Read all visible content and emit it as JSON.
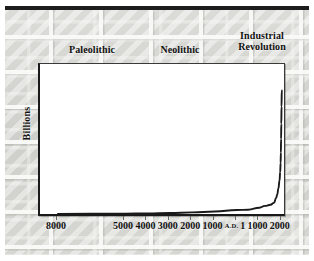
{
  "figure": {
    "title_eras": [
      {
        "label": "Paleolithic",
        "name": "era-label-paleolithic"
      },
      {
        "label": "Neolithic",
        "name": "era-label-neolithic"
      },
      {
        "label": "Industrial\nRevolution",
        "name": "era-label-industrial-revolution"
      }
    ],
    "background": "stone-wall-texture",
    "colors": {
      "wall": "#d6d6d2",
      "plot_background": "#ffffff",
      "axis": "#1a1a1a",
      "curve": "#1a1a1a",
      "text": "#111111"
    }
  },
  "eras": {
    "paleolithic": "Paleolithic",
    "neolithic": "Neolithic",
    "industrial_line1": "Industrial",
    "industrial_line2": "Revolution"
  },
  "axis": {
    "y_title": "Billions",
    "y_ticks": [
      "7",
      "6",
      "5",
      "4",
      "3",
      "2",
      "1"
    ],
    "x_ticks": [
      "8000",
      "5000",
      "4000",
      "3000",
      "2000",
      "1000",
      "1",
      "1000",
      "2000"
    ],
    "x_ad_prefix": "A.D."
  },
  "chart_data": {
    "type": "line",
    "title": "",
    "subtitle": "",
    "xlabel": "",
    "ylabel": "Billions",
    "grid": false,
    "legend": null,
    "annotations": [
      {
        "text": "Paleolithic",
        "position": "above-plot-left"
      },
      {
        "text": "Neolithic",
        "position": "above-plot-center"
      },
      {
        "text": "Industrial Revolution",
        "position": "above-plot-right"
      }
    ],
    "x_tick_labels": [
      "8000",
      "5000",
      "4000",
      "3000",
      "2000",
      "1000",
      "A.D. 1",
      "1000",
      "2000"
    ],
    "x_tick_years": [
      -8000,
      -5000,
      -4000,
      -3000,
      -2000,
      -1000,
      1,
      1000,
      2000
    ],
    "y_tick_labels": [
      "1",
      "2",
      "3",
      "4",
      "5",
      "6",
      "7"
    ],
    "ylim": [
      0,
      7.4
    ],
    "xlim": [
      -8800,
      2100
    ],
    "series": [
      {
        "name": "World population",
        "x": [
          -8000,
          -5000,
          -4000,
          -3000,
          -2000,
          -1000,
          1,
          500,
          1000,
          1250,
          1500,
          1650,
          1750,
          1800,
          1850,
          1900,
          1930,
          1950,
          1960,
          1970,
          1980,
          1990,
          2000
        ],
        "values": [
          0.005,
          0.02,
          0.03,
          0.05,
          0.08,
          0.12,
          0.2,
          0.21,
          0.31,
          0.4,
          0.46,
          0.55,
          0.79,
          0.98,
          1.26,
          1.65,
          2.07,
          2.53,
          3.03,
          3.7,
          4.45,
          5.3,
          6.1
        ]
      }
    ]
  }
}
